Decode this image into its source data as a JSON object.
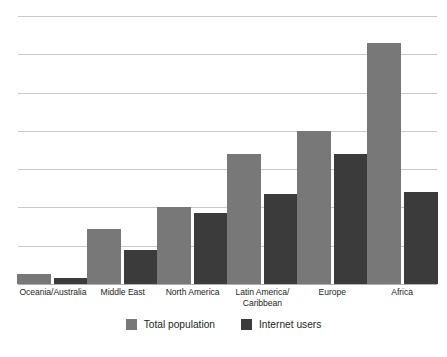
{
  "chart_data": {
    "type": "bar",
    "title": "",
    "subtitle": "",
    "xlabel": "",
    "ylabel": "",
    "grid": true,
    "axis_tick_labels": [],
    "ylim": [
      0,
      7
    ],
    "gridline_count": 8,
    "legend_position": "bottom-center",
    "categories": [
      "Oceania/Australia",
      "Middle East",
      "North America",
      "Latin America/\nCaribbean",
      "Europe",
      "Africa"
    ],
    "series": [
      {
        "name": "Total population",
        "color": "#787878",
        "values": [
          0.25,
          1.45,
          2.0,
          3.4,
          4.0,
          6.3
        ]
      },
      {
        "name": "Internet users",
        "color": "#3b3b3b",
        "values": [
          0.15,
          0.9,
          1.85,
          2.35,
          3.4,
          2.4
        ]
      }
    ]
  },
  "legend": {
    "items": [
      {
        "label": "Total population",
        "swatch": "total"
      },
      {
        "label": "Internet users",
        "swatch": "internet"
      }
    ]
  },
  "colors": {
    "total_population": "#787878",
    "internet_users": "#3b3b3b",
    "gridline": "#c9c9c9",
    "baseline": "#b0b0b0",
    "text": "#231f20",
    "background": "#ffffff"
  }
}
